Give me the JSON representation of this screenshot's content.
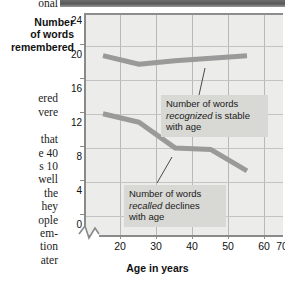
{
  "figure": {
    "column_text_fragments": [
      "onal",
      "Number",
      "of words",
      "remembered",
      "ered",
      "vere",
      "that",
      "e 40",
      "s 10",
      "well",
      "the",
      "hey",
      "ople",
      "em-",
      "tion",
      "ater"
    ],
    "left_column_lines": [
      "onal",
      "ered",
      "vere",
      "that",
      "e 40",
      "s 10",
      "well",
      "the",
      "hey",
      "ople",
      "em-",
      "tion",
      "ater"
    ],
    "y_axis_title_lines": [
      "Number",
      "of words",
      "remembered"
    ],
    "x_axis_title": "Age in years",
    "annotations": {
      "recognized": {
        "line1_plain": "Number of words",
        "line2_italic": "recognized",
        "line2_plain": " is stable",
        "line3_plain": "with age"
      },
      "recalled": {
        "line1_plain": "Number of words",
        "line2_italic": "recalled",
        "line2_plain": " declines",
        "line3_plain": "with age"
      }
    },
    "colors": {
      "plot_background": "#ececea",
      "grid": "#b9b9b9",
      "series": "#9a9a9a",
      "callout_background": "#d8d8d4",
      "axis": "#8a8a8a",
      "text": "#111111"
    }
  },
  "chart_data": {
    "type": "line",
    "title": "",
    "xlabel": "Age in years",
    "ylabel": "Number of words remembered",
    "x": [
      20,
      30,
      40,
      50,
      60
    ],
    "xlim": [
      15,
      70
    ],
    "ylim": [
      0,
      26
    ],
    "xticks": [
      20,
      30,
      40,
      50,
      60,
      70
    ],
    "yticks": [
      0,
      4,
      8,
      12,
      16,
      20,
      24
    ],
    "grid": true,
    "legend": "none",
    "axis_break": "x-axis broken between 0 and 20",
    "series": [
      {
        "name": "Number of words recognized",
        "values": [
          21,
          20,
          20.4,
          20.7,
          21
        ],
        "annotation": "Number of words recognized is stable with age"
      },
      {
        "name": "Number of words recalled",
        "values": [
          14.2,
          13.2,
          10.2,
          10,
          7.5
        ],
        "annotation": "Number of words recalled declines with age"
      }
    ]
  }
}
